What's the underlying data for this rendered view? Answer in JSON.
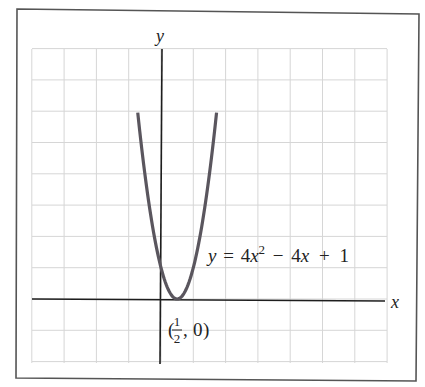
{
  "chart_data": {
    "type": "line",
    "title": "",
    "xlabel": "x",
    "ylabel": "y",
    "equation_label": {
      "lhs": "y",
      "eq": "=",
      "coef_a": "4",
      "var_a": "x",
      "exp_a": "2",
      "op1": "−",
      "coef_b": "4",
      "var_b": "x",
      "op2": "+",
      "const": "1"
    },
    "annotation": {
      "open": "(",
      "frac_num": "1",
      "frac_den": "2",
      "sep": ",",
      "y_val": "0",
      "close": ")",
      "point": [
        0.5,
        0
      ]
    },
    "function": "y = 4x^2 - 4x + 1",
    "x_domain": [
      -0.72,
      1.72
    ],
    "series": [
      {
        "name": "y = 4x^2 - 4x + 1",
        "x": [
          -0.72,
          -0.5,
          -0.25,
          0,
          0.25,
          0.5,
          0.75,
          1,
          1.25,
          1.5,
          1.72
        ],
        "values": [
          5.95,
          4,
          2.25,
          1,
          0.25,
          0,
          0.25,
          1,
          2.25,
          4,
          5.95
        ]
      }
    ],
    "xlim": [
      -4,
      7
    ],
    "ylim": [
      -2,
      8
    ],
    "grid": true,
    "tick_labels_shown": false,
    "legend": "none"
  }
}
